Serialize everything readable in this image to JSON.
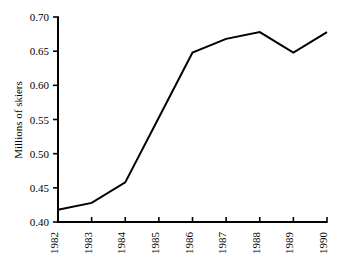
{
  "chart_data": {
    "type": "line",
    "title": "",
    "subtitle": "",
    "xlabel": "",
    "ylabel": "Millions of skiers",
    "categories": [
      "1982",
      "1983",
      "1984",
      "1985",
      "1986",
      "1987",
      "1988",
      "1989",
      "1990"
    ],
    "x": [
      1982,
      1983,
      1984,
      1985,
      1986,
      1987,
      1988,
      1989,
      1990
    ],
    "values": [
      0.418,
      0.428,
      0.458,
      0.553,
      0.648,
      0.668,
      0.678,
      0.648,
      0.678
    ],
    "series": [
      {
        "name": "Millions of skiers",
        "values": [
          0.418,
          0.428,
          0.458,
          0.553,
          0.648,
          0.668,
          0.678,
          0.648,
          0.678
        ]
      }
    ],
    "ylim": [
      0.4,
      0.7
    ],
    "yticks": [
      0.4,
      0.45,
      0.5,
      0.55,
      0.6,
      0.65,
      0.7
    ],
    "ytick_labels": [
      "0.40",
      "0.45",
      "0.50",
      "0.55",
      "0.60",
      "0.65",
      "0.70"
    ],
    "xtick_labels": [
      "1982",
      "1983",
      "1984",
      "1985",
      "1986",
      "1987",
      "1988",
      "1989",
      "1990"
    ],
    "grid": false,
    "legend": false,
    "legend_position": "none",
    "line_color": "#000000",
    "line_width": 2,
    "axis_color": "#000000",
    "background_color": "#ffffff",
    "xtick_label_rotation": -90,
    "ylabel_rotation": -90,
    "markers": false
  }
}
